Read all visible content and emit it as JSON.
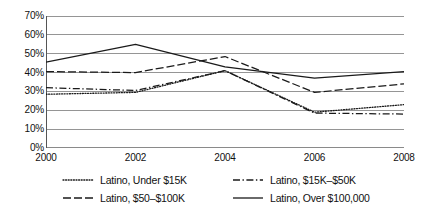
{
  "chart_data": {
    "type": "line",
    "title": "",
    "xlabel": "",
    "ylabel": "",
    "categories": [
      "2000",
      "2002",
      "2004",
      "2006",
      "2008"
    ],
    "ylim": [
      0,
      70
    ],
    "ytick_labels": [
      "70%",
      "60%",
      "50%",
      "40%",
      "30%",
      "20%",
      "10%",
      "0%"
    ],
    "ytick_values": [
      70,
      60,
      50,
      40,
      30,
      20,
      10,
      0
    ],
    "grid": true,
    "legend_position": "bottom",
    "series": [
      {
        "name": "Latino, Under $15K",
        "style": "dotted",
        "color": "#1a1a1a",
        "values": [
          28.5,
          29.5,
          41,
          19,
          23
        ]
      },
      {
        "name": "Latino, $15K–$50K",
        "style": "dash-dot",
        "color": "#1a1a1a",
        "values": [
          32,
          30.5,
          41,
          18.5,
          18
        ]
      },
      {
        "name": "Latino, $50–$100K",
        "style": "dashed",
        "color": "#1a1a1a",
        "values": [
          40.5,
          40,
          48.5,
          29.5,
          34
        ]
      },
      {
        "name": "Latino, Over $100,000",
        "style": "solid",
        "color": "#1a1a1a",
        "values": [
          45.5,
          55,
          43,
          37,
          40.5
        ]
      }
    ]
  },
  "legend": {
    "entries": [
      {
        "label": "Latino, Under $15K",
        "swatch": "dotted-line-icon"
      },
      {
        "label": "Latino, $15K–$50K",
        "swatch": "dash-dot-line-icon"
      },
      {
        "label": "Latino, $50–$100K",
        "swatch": "dashed-line-icon"
      },
      {
        "label": "Latino, Over $100,000",
        "swatch": "solid-line-icon"
      }
    ]
  }
}
